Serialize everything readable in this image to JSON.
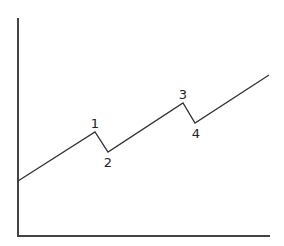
{
  "chart_data": {
    "type": "line",
    "title": "",
    "xlabel": "",
    "ylabel": "",
    "grid": false,
    "legend": null,
    "axes": {
      "origin": [
        18,
        236
      ],
      "y_top": 18,
      "x_right": 270
    },
    "points": [
      {
        "x": 18,
        "y": 181,
        "label": ""
      },
      {
        "x": 95,
        "y": 132,
        "label": "1"
      },
      {
        "x": 108,
        "y": 152,
        "label": "2"
      },
      {
        "x": 183,
        "y": 103,
        "label": "3"
      },
      {
        "x": 195,
        "y": 123,
        "label": "4"
      },
      {
        "x": 269,
        "y": 75,
        "label": ""
      }
    ],
    "annotations": [
      {
        "text": "1",
        "x": 95,
        "y": 128
      },
      {
        "text": "2",
        "x": 108,
        "y": 167
      },
      {
        "text": "3",
        "x": 183,
        "y": 99
      },
      {
        "text": "4",
        "x": 196,
        "y": 138
      }
    ]
  }
}
